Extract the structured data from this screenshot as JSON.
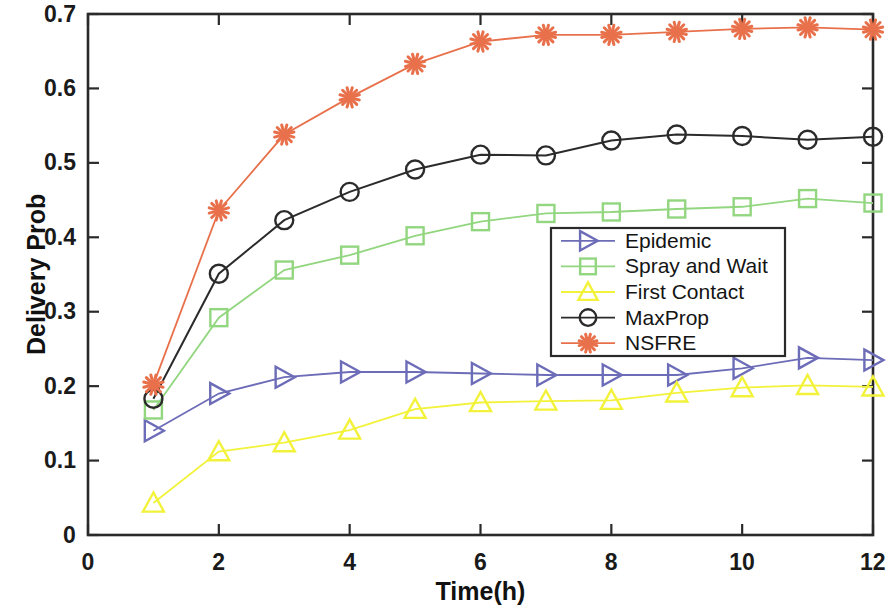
{
  "chart_data": {
    "type": "line",
    "title": "",
    "xlabel": "Time(h)",
    "ylabel": "Delivery Prob",
    "xlim": [
      0,
      12
    ],
    "ylim": [
      0,
      0.7
    ],
    "grid": false,
    "legend_position": "center-right",
    "xticks": [
      "0",
      "2",
      "4",
      "6",
      "8",
      "10",
      "12"
    ],
    "xtick_values": [
      0,
      2,
      4,
      6,
      8,
      10,
      12
    ],
    "yticks": [
      "0",
      "0.1",
      "0.2",
      "0.3",
      "0.4",
      "0.5",
      "0.6",
      "0.7"
    ],
    "ytick_values": [
      0,
      0.1,
      0.2,
      0.3,
      0.4,
      0.5,
      0.6,
      0.7
    ],
    "x": [
      1,
      2,
      3,
      4,
      5,
      6,
      7,
      8,
      9,
      10,
      11,
      12
    ],
    "series": [
      {
        "name": "Epidemic",
        "color": "#6c6cb8",
        "marker": "triangle-right",
        "values": [
          0.14,
          0.19,
          0.212,
          0.219,
          0.219,
          0.217,
          0.215,
          0.215,
          0.215,
          0.224,
          0.238,
          0.235
        ]
      },
      {
        "name": "Spray and Wait",
        "color": "#92d67f",
        "marker": "square",
        "values": [
          0.168,
          0.292,
          0.356,
          0.376,
          0.402,
          0.421,
          0.432,
          0.434,
          0.438,
          0.441,
          0.452,
          0.446
        ]
      },
      {
        "name": "First Contact",
        "color": "#f2f23a",
        "marker": "triangle-up",
        "values": [
          0.043,
          0.112,
          0.124,
          0.141,
          0.169,
          0.178,
          0.18,
          0.181,
          0.191,
          0.198,
          0.201,
          0.199
        ]
      },
      {
        "name": "MaxProp",
        "color": "#2b2b2b",
        "marker": "circle",
        "values": [
          0.183,
          0.351,
          0.423,
          0.461,
          0.491,
          0.511,
          0.51,
          0.53,
          0.538,
          0.536,
          0.531,
          0.535
        ]
      },
      {
        "name": "NSFRE",
        "color": "#e8714c",
        "marker": "asterisk",
        "values": [
          0.202,
          0.436,
          0.538,
          0.588,
          0.633,
          0.663,
          0.672,
          0.672,
          0.676,
          0.68,
          0.682,
          0.679
        ]
      }
    ]
  },
  "legend": {
    "entries": [
      {
        "label": "Epidemic"
      },
      {
        "label": "Spray and Wait"
      },
      {
        "label": "First Contact"
      },
      {
        "label": "MaxProp"
      },
      {
        "label": "NSFRE"
      }
    ]
  },
  "axes": {
    "frame_color": "#2a2a2a"
  }
}
